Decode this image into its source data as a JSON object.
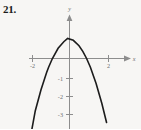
{
  "figure": {
    "problem_number": "21.",
    "background_color": "#f7f6f4",
    "curve_color": "#1c1c1c",
    "axis_color": "#8d8d8d"
  },
  "chart_data": {
    "type": "line",
    "title": "",
    "subtitle": "",
    "xlabel": "x",
    "ylabel": "y",
    "xlim": [
      -2.6,
      2.6
    ],
    "ylim": [
      -3.9,
      1.7
    ],
    "grid": false,
    "legend": null,
    "x_ticks": [
      -2,
      2
    ],
    "x_tick_labels": [
      "-2",
      "2"
    ],
    "y_ticks": [
      -1,
      -2,
      -3
    ],
    "y_tick_labels": [
      "-1",
      "-2",
      "-3"
    ],
    "annotations": [],
    "series": [
      {
        "name": "parabola",
        "description": "downward-opening parabola",
        "vertex": [
          -0.1,
          1.0
        ],
        "x_intercepts": [
          -1.1,
          0.9
        ],
        "x": [
          -2.05,
          -1.8,
          -1.5,
          -1.2,
          -1.1,
          -0.9,
          -0.6,
          -0.3,
          -0.1,
          0.2,
          0.5,
          0.7,
          0.9,
          1.1,
          1.4,
          1.7,
          1.95
        ],
        "values": [
          -3.9,
          -2.61,
          -1.56,
          -0.69,
          -0.44,
          -0.0,
          0.51,
          0.84,
          1.0,
          0.91,
          0.64,
          0.36,
          0.0,
          -0.44,
          -1.25,
          -2.24,
          -3.2
        ]
      }
    ]
  },
  "axis_marks": {
    "x_arrow_label": "x",
    "y_arrow_label": "y"
  }
}
